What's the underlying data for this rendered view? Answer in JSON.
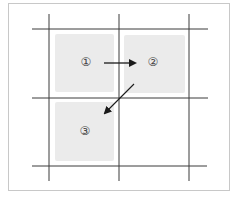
{
  "diagram": {
    "colors": {
      "grid_line": "#3a3a3a",
      "cell_fill": "#ebebeb",
      "frame_border": "#c8c8c8",
      "arrow": "#1a1a1a",
      "label": "#444444"
    },
    "cells": [
      {
        "id": 1,
        "label": "①",
        "x": 55,
        "y": 34,
        "w": 59,
        "h": 58
      },
      {
        "id": 2,
        "label": "②",
        "x": 124,
        "y": 35,
        "w": 61,
        "h": 58
      },
      {
        "id": 3,
        "label": "③",
        "x": 55,
        "y": 102,
        "w": 59,
        "h": 59
      }
    ],
    "arrows": [
      {
        "from": 1,
        "to": 2,
        "direction": "right"
      },
      {
        "from": 2,
        "to": 3,
        "direction": "down-left"
      }
    ],
    "labels": {
      "cell1": "①",
      "cell2": "②",
      "cell3": "③"
    }
  }
}
